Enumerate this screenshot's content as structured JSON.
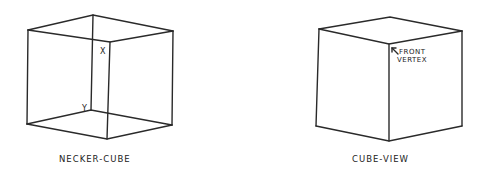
{
  "figures": [
    {
      "id": "necker-cube",
      "caption": "NECKER-CUBE",
      "vertex_labels": [
        "X",
        "Y"
      ]
    },
    {
      "id": "cube-view",
      "caption": "CUBE-VIEW",
      "annotation_line1": "FRONT",
      "annotation_line2": "VERTEX"
    }
  ],
  "colors": {
    "ink": "#2a2a2a",
    "background": "#ffffff"
  }
}
